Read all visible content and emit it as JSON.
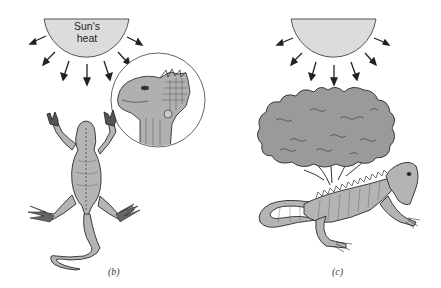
{
  "figure": {
    "panels": [
      {
        "id": "b",
        "label": "(b)",
        "sun": {
          "label_line1": "Sun's",
          "label_line2": "heat",
          "rays": 8
        },
        "subjects": [
          "lizard-dorsal-view",
          "magnified-head-inset"
        ]
      },
      {
        "id": "c",
        "label": "(c)",
        "sun": {
          "label_line1": "",
          "label_line2": "",
          "rays": 8
        },
        "subjects": [
          "tree-shade",
          "lizard-side-view"
        ]
      }
    ],
    "colors": {
      "sun_fill": "#dcdcdc",
      "sun_stroke": "#555555",
      "lizard_fill": "#b4b4b4",
      "tree_fill": "#9a9a9a",
      "line": "#2a2a2a",
      "background": "#ffffff"
    }
  }
}
